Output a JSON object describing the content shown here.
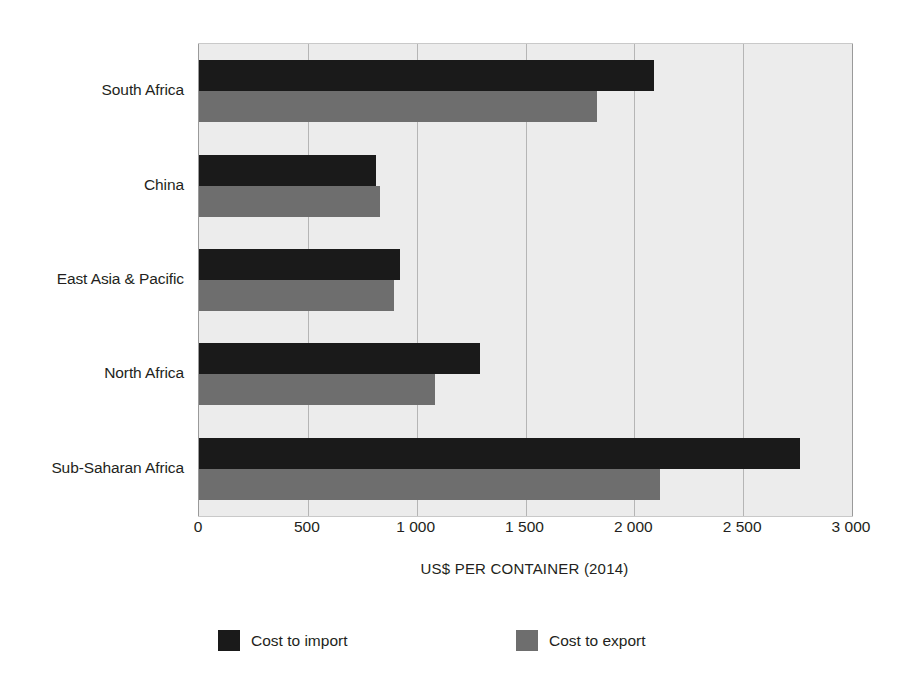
{
  "chart_data": {
    "type": "bar",
    "orientation": "horizontal",
    "title": "",
    "xlabel": "US$ PER CONTAINER (2014)",
    "ylabel": "",
    "xlim": [
      0,
      3000
    ],
    "xticks": [
      0,
      500,
      1000,
      1500,
      2000,
      2500,
      3000
    ],
    "xtick_labels": [
      "0",
      "500",
      "1 000",
      "1 500",
      "2 000",
      "2 500",
      "3 000"
    ],
    "grid": true,
    "legend_position": "bottom",
    "categories": [
      "South Africa",
      "China",
      "East Asia & Pacific",
      "North Africa",
      "Sub-Saharan Africa"
    ],
    "series": [
      {
        "name": "Cost to import",
        "color": "#1a1a1a",
        "values": [
          2090,
          815,
          925,
          1290,
          2760
        ]
      },
      {
        "name": "Cost to export",
        "color": "#6e6e6e",
        "values": [
          1830,
          830,
          895,
          1085,
          2120
        ]
      }
    ]
  },
  "legend": {
    "items": [
      {
        "label": "Cost to import",
        "color": "#1a1a1a"
      },
      {
        "label": "Cost to export",
        "color": "#6e6e6e"
      }
    ]
  },
  "colors": {
    "plot_background": "#ececec",
    "gridline": "#b5b5b5",
    "import_bar": "#1a1a1a",
    "export_bar": "#6e6e6e",
    "text": "#231f20"
  }
}
